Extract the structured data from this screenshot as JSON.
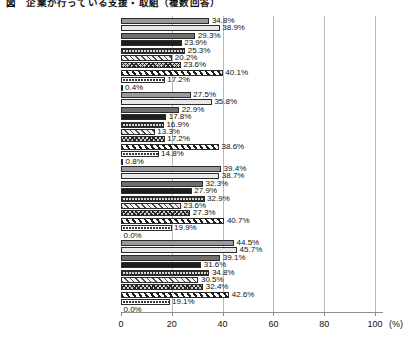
{
  "chart_data": {
    "type": "bar",
    "orientation": "horizontal",
    "title": "図　企業が行っている支援・取組（複数回答）",
    "xlabel": "",
    "ylabel": "",
    "unit": "(%)",
    "xlim": [
      0,
      100
    ],
    "xticks": [
      0,
      20,
      40,
      60,
      80,
      100
    ],
    "xticklabels": [
      "0",
      "20",
      "40",
      "60",
      "80",
      "100"
    ],
    "grid": true,
    "legend": "none",
    "value_label_suffix": "%",
    "categories": [
      "全体(n=1081)",
      "100人未満(n=528)",
      "100〜1000人未満(n=297)",
      "1000人以上(n=256)"
    ],
    "series": [
      {
        "name": "series-1",
        "values": [
          34.8,
          27.5,
          39.4,
          44.5
        ]
      },
      {
        "name": "series-2",
        "values": [
          38.9,
          35.8,
          38.7,
          45.7
        ]
      },
      {
        "name": "series-3",
        "values": [
          29.3,
          22.9,
          32.3,
          39.1
        ]
      },
      {
        "name": "series-4",
        "values": [
          23.9,
          17.8,
          27.9,
          31.6
        ]
      },
      {
        "name": "series-5",
        "values": [
          25.3,
          16.9,
          32.9,
          34.8
        ]
      },
      {
        "name": "series-6",
        "values": [
          20.2,
          13.3,
          23.6,
          30.5
        ]
      },
      {
        "name": "series-7",
        "values": [
          23.6,
          17.2,
          27.3,
          32.4
        ]
      },
      {
        "name": "series-8",
        "values": [
          40.1,
          38.6,
          40.7,
          42.6
        ]
      },
      {
        "name": "series-9",
        "values": [
          17.2,
          14.8,
          19.9,
          19.1
        ]
      },
      {
        "name": "series-10",
        "values": [
          0.4,
          0.8,
          0.0,
          0.0
        ]
      }
    ],
    "groups": [
      {
        "label": "全体(n=1081)",
        "values": [
          34.8,
          38.9,
          29.3,
          23.9,
          25.3,
          20.2,
          23.6,
          40.1,
          17.2,
          0.4
        ],
        "labels": [
          "34.8%",
          "38.9%",
          "29.3%",
          "23.9%",
          "25.3%",
          "20.2%",
          "23.6%",
          "40.1%",
          "17.2%",
          "0.4%"
        ]
      },
      {
        "label": "100人未満(n=528)",
        "values": [
          27.5,
          35.8,
          22.9,
          17.8,
          16.9,
          13.3,
          17.2,
          38.6,
          14.8,
          0.8
        ],
        "labels": [
          "27.5%",
          "35.8%",
          "22.9%",
          "17.8%",
          "16.9%",
          "13.3%",
          "17.2%",
          "38.6%",
          "14.8%",
          "0.8%"
        ]
      },
      {
        "label": "100〜1000人未満(n=297)",
        "values": [
          39.4,
          38.7,
          32.3,
          27.9,
          32.9,
          23.6,
          27.3,
          40.7,
          19.9,
          0.0
        ],
        "labels": [
          "39.4%",
          "38.7%",
          "32.3%",
          "27.9%",
          "32.9%",
          "23.6%",
          "27.3%",
          "40.7%",
          "19.9%",
          "0.0%"
        ]
      },
      {
        "label": "1000人以上(n=256)",
        "values": [
          44.5,
          45.7,
          39.1,
          31.6,
          34.8,
          30.5,
          32.4,
          42.6,
          19.1,
          0.0
        ],
        "labels": [
          "44.5%",
          "45.7%",
          "39.1%",
          "31.6%",
          "34.8%",
          "30.5%",
          "32.4%",
          "42.6%",
          "19.1%",
          "0.0%"
        ]
      }
    ]
  }
}
